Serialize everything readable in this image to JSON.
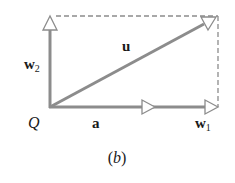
{
  "diagram": {
    "caption": "(b)",
    "caption_letter": "b",
    "colors": {
      "vector": "#8c8c8c",
      "dashed": "#8c8c8c",
      "text": "#1a1a1a",
      "background": "#ffffff"
    },
    "labels": {
      "origin": "Q",
      "vector_a": "a",
      "vector_u": "u",
      "vector_w1": "w",
      "vector_w1_sub": "1",
      "vector_w2": "w",
      "vector_w2_sub": "2"
    },
    "elements": [
      {
        "name": "vector-w2",
        "from": [
          50,
          107
        ],
        "to": [
          50,
          16
        ],
        "style": "solid"
      },
      {
        "name": "vector-w1",
        "from": [
          50,
          107
        ],
        "to": [
          218,
          107
        ],
        "style": "solid"
      },
      {
        "name": "vector-a",
        "from": [
          50,
          107
        ],
        "to": [
          155,
          107
        ],
        "style": "solid"
      },
      {
        "name": "vector-u",
        "from": [
          50,
          107
        ],
        "to": [
          216,
          17
        ],
        "style": "solid"
      },
      {
        "name": "dashed-top",
        "from": [
          50,
          16
        ],
        "to": [
          218,
          16
        ],
        "style": "dashed"
      },
      {
        "name": "dashed-right",
        "from": [
          218,
          16
        ],
        "to": [
          218,
          107
        ],
        "style": "dashed"
      }
    ]
  }
}
